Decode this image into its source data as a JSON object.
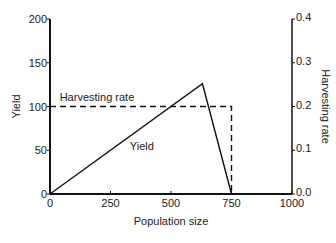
{
  "chart_data": {
    "type": "line",
    "title": "",
    "xlabel": "Population size",
    "ylabel": "Yield",
    "y2label": "Harvesting rate",
    "xlim": [
      0,
      1000
    ],
    "ylim": [
      0,
      200
    ],
    "y2lim": [
      0.0,
      0.4
    ],
    "x_ticks": [
      "0",
      "250",
      "500",
      "750",
      "1000"
    ],
    "y_ticks": [
      "0",
      "50",
      "100",
      "150",
      "200"
    ],
    "y2_ticks": [
      "0.0",
      "0.1",
      "0.2",
      "0.3",
      "0.4"
    ],
    "grid": false,
    "series": [
      {
        "name": "Yield",
        "style": "solid",
        "axis": "left",
        "x": [
          0,
          630,
          750
        ],
        "y": [
          0,
          126,
          0
        ]
      },
      {
        "name": "Harvesting rate",
        "style": "dashed",
        "axis": "right",
        "x": [
          0,
          750,
          750
        ],
        "y": [
          0.2,
          0.2,
          0.0
        ]
      }
    ],
    "annotations": [
      {
        "text": "Harvesting rate",
        "x": 40,
        "y": 106
      },
      {
        "text": "Yield",
        "x": 330,
        "y": 50
      }
    ]
  }
}
